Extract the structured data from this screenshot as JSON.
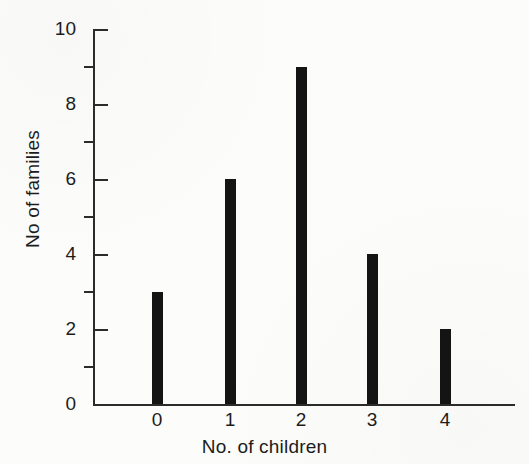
{
  "chart_data": {
    "type": "bar",
    "title": "",
    "subtitle": "",
    "xlabel": "No. of children",
    "ylabel": "No of families",
    "categories": [
      "0",
      "1",
      "2",
      "3",
      "4"
    ],
    "values": [
      3,
      6,
      9,
      4,
      2
    ],
    "series": [
      {
        "name": "No of families",
        "values": [
          3,
          6,
          9,
          4,
          2
        ]
      }
    ],
    "ylim": [
      0,
      10
    ],
    "xlim": [
      -0.5,
      4.8
    ],
    "y_major_ticks": [
      0,
      2,
      4,
      6,
      8,
      10
    ],
    "y_minor_ticks": [
      1,
      3,
      5,
      7,
      9
    ],
    "y_tick_labels": [
      "0",
      "2",
      "4",
      "6",
      "8",
      "10"
    ],
    "x_tick_labels": [
      "0",
      "1",
      "2",
      "3",
      "4"
    ],
    "grid": false,
    "legend": null,
    "legend_position": "none",
    "annotations": [],
    "bar_color": "#141414",
    "axis_color": "#2b2b2b",
    "background_color": "#fcfcfa"
  }
}
